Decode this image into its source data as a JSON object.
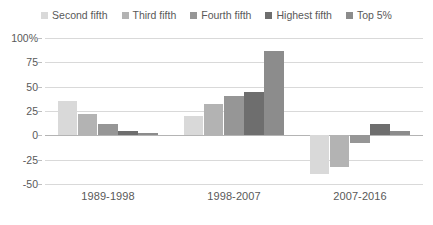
{
  "chart_data": {
    "type": "bar",
    "title": "",
    "subtitle": "",
    "xlabel": "",
    "ylabel": "",
    "categories": [
      "1989-1998",
      "1998-2007",
      "2007-2016"
    ],
    "series": [
      {
        "name": "Second fifth",
        "color": "#d9d9d9",
        "hatch": false,
        "values": [
          35,
          20,
          -40
        ]
      },
      {
        "name": "Third fifth",
        "color": "#b3b3b3",
        "hatch": false,
        "values": [
          22,
          32,
          -33
        ]
      },
      {
        "name": "Fourth fifth",
        "color": "#969696",
        "hatch": false,
        "values": [
          12,
          40,
          -8
        ]
      },
      {
        "name": "Highest fifth",
        "color": "#6e6e6e",
        "hatch": false,
        "values": [
          4,
          45,
          12
        ]
      },
      {
        "name": "Top 5%",
        "color": "#8c8c8c",
        "hatch": true,
        "values": [
          2,
          87,
          4
        ]
      }
    ],
    "ylim": [
      -50,
      100
    ],
    "yticks": [
      100,
      75,
      50,
      25,
      0,
      -25,
      -50
    ],
    "ytick_labels": [
      "100%",
      "75",
      "50",
      "25",
      "0",
      "-25",
      "-50"
    ],
    "grid": true,
    "legend_position": "top",
    "zero_line": 0
  },
  "colors": {
    "grid": "#d9d9d9",
    "axis": "#b4b4b4",
    "text": "#595959",
    "background": "#ffffff"
  }
}
